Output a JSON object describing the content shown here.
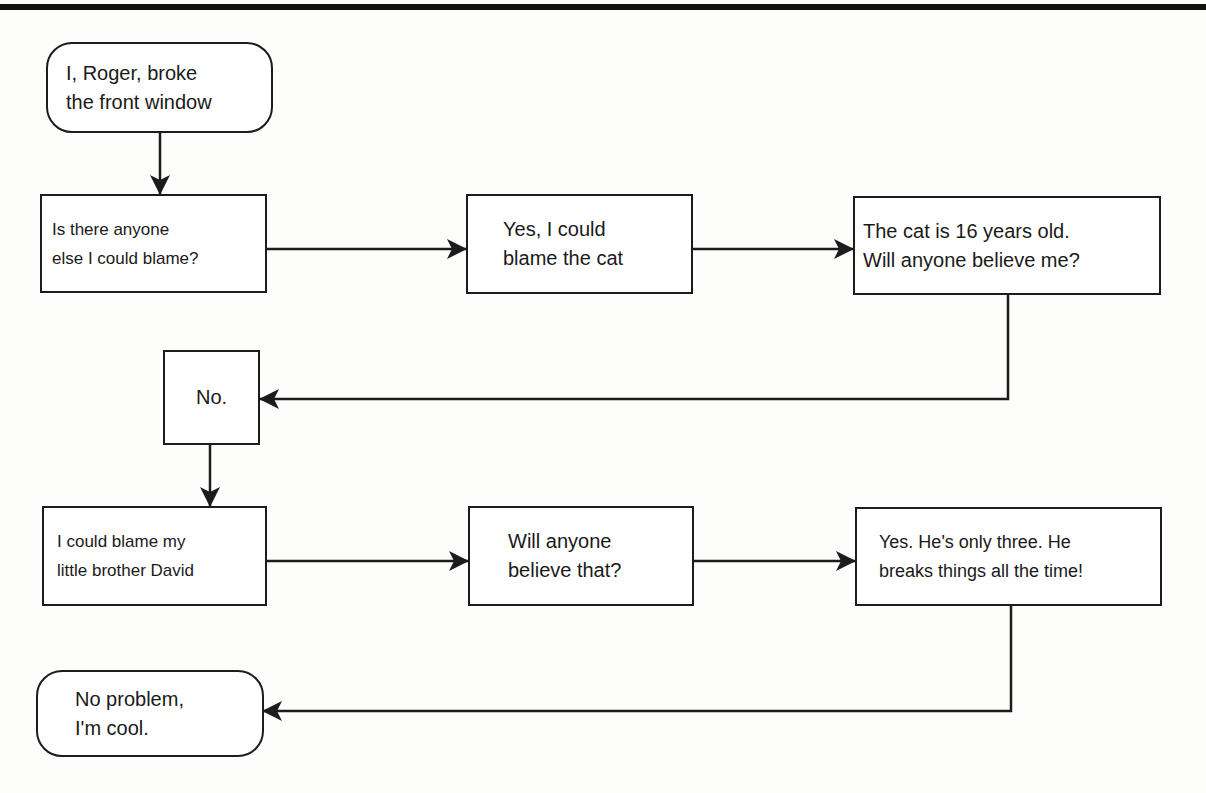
{
  "diagram": {
    "type": "flowchart",
    "nodes": [
      {
        "id": "start",
        "shape": "rounded",
        "text": "I, Roger, broke\nthe front window"
      },
      {
        "id": "q_blame",
        "shape": "rect",
        "text": "Is there anyone\nelse I could blame?"
      },
      {
        "id": "cat",
        "shape": "rect",
        "text": "Yes, I could\nblame the cat"
      },
      {
        "id": "cat_old",
        "shape": "rect",
        "text": "The cat is 16 years old.\nWill anyone believe me?"
      },
      {
        "id": "no",
        "shape": "rect",
        "text": "No."
      },
      {
        "id": "brother",
        "shape": "rect",
        "text": "I could blame my\nlittle brother David"
      },
      {
        "id": "believe",
        "shape": "rect",
        "text": "Will anyone\nbelieve that?"
      },
      {
        "id": "yes_three",
        "shape": "rect",
        "text": "Yes. He's only three. He\nbreaks things all the time!"
      },
      {
        "id": "end",
        "shape": "rounded",
        "text": "No problem,\nI'm cool."
      }
    ],
    "edges": [
      {
        "from": "start",
        "to": "q_blame"
      },
      {
        "from": "q_blame",
        "to": "cat"
      },
      {
        "from": "cat",
        "to": "cat_old"
      },
      {
        "from": "cat_old",
        "to": "no"
      },
      {
        "from": "no",
        "to": "brother"
      },
      {
        "from": "brother",
        "to": "believe"
      },
      {
        "from": "believe",
        "to": "yes_three"
      },
      {
        "from": "yes_three",
        "to": "end"
      }
    ],
    "colors": {
      "stroke": "#1c1c1c",
      "fill": "#ffffff",
      "background": "#fdfdfc"
    }
  }
}
